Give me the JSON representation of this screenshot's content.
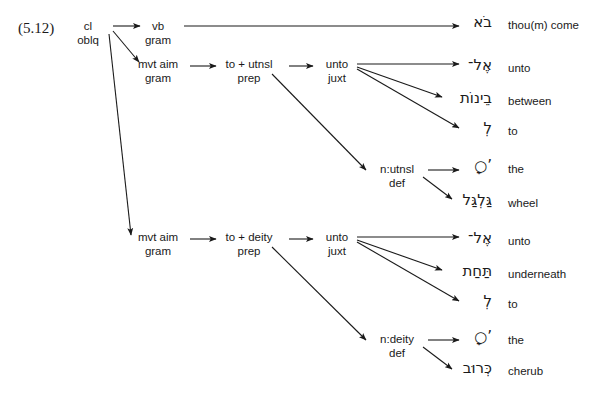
{
  "figure": {
    "number": "(5.12)",
    "canvas": {
      "width": 602,
      "height": 408
    },
    "ink_color": "#1a1a1a",
    "background_color": "#ffffff"
  },
  "nodes": [
    {
      "id": "root",
      "line1": "cl",
      "line2": "oblq",
      "x": 88,
      "y": 20
    },
    {
      "id": "vb",
      "line1": "vb",
      "line2": "gram",
      "x": 158,
      "y": 20
    },
    {
      "id": "mvt1",
      "line1": "mvt aim",
      "line2": "gram",
      "x": 158,
      "y": 58
    },
    {
      "id": "prep1",
      "line1": "to + utnsl",
      "line2": "prep",
      "x": 249,
      "y": 58
    },
    {
      "id": "juxt1",
      "line1": "unto",
      "line2": "juxt",
      "x": 337,
      "y": 58
    },
    {
      "id": "def1",
      "line1": "n:utnsl",
      "line2": "def",
      "x": 397,
      "y": 163
    },
    {
      "id": "mvt2",
      "line1": "mvt aim",
      "line2": "gram",
      "x": 158,
      "y": 231
    },
    {
      "id": "prep2",
      "line1": "to + deity",
      "line2": "prep",
      "x": 249,
      "y": 231
    },
    {
      "id": "juxt2",
      "line1": "unto",
      "line2": "juxt",
      "x": 337,
      "y": 231
    },
    {
      "id": "def2",
      "line1": "n:deity",
      "line2": "def",
      "x": 397,
      "y": 333
    }
  ],
  "terminals": [
    {
      "id": "t-come",
      "hebrew": "בֹא",
      "gloss": "thou(m) come",
      "hx": 492,
      "hy": 14,
      "gx": 508,
      "gy": 18
    },
    {
      "id": "t-unto-1",
      "hebrew": "אֶל־",
      "gloss": "unto",
      "hx": 492,
      "hy": 57,
      "gx": 508,
      "gy": 61
    },
    {
      "id": "t-between",
      "hebrew": "בֵינוֹת",
      "gloss": "between",
      "hx": 492,
      "hy": 90,
      "gx": 508,
      "gy": 94
    },
    {
      "id": "t-to-1",
      "hebrew": "לְ",
      "gloss": "to",
      "hx": 492,
      "hy": 120,
      "gx": 508,
      "gy": 124
    },
    {
      "id": "t-the-1",
      "hebrew": "’○ָ",
      "gloss": "the",
      "hx": 492,
      "hy": 158,
      "gx": 508,
      "gy": 162
    },
    {
      "id": "t-wheel",
      "hebrew": "גַּלְגַּל",
      "gloss": "wheel",
      "hx": 492,
      "hy": 192,
      "gx": 508,
      "gy": 196
    },
    {
      "id": "t-unto-2",
      "hebrew": "אֶל־",
      "gloss": "unto",
      "hx": 492,
      "hy": 230,
      "gx": 508,
      "gy": 234
    },
    {
      "id": "t-underneath",
      "hebrew": "תַּחַת",
      "gloss": "underneath",
      "hx": 492,
      "hy": 263,
      "gx": 508,
      "gy": 267
    },
    {
      "id": "t-to-2",
      "hebrew": "לְ",
      "gloss": "to",
      "hx": 492,
      "hy": 293,
      "gx": 508,
      "gy": 297
    },
    {
      "id": "t-the-2",
      "hebrew": "’○ָ",
      "gloss": "the",
      "hx": 492,
      "hy": 329,
      "gx": 508,
      "gy": 333
    },
    {
      "id": "t-cherub",
      "hebrew": "כְּרוּב",
      "gloss": "cherub",
      "hx": 492,
      "hy": 360,
      "gx": 508,
      "gy": 364
    }
  ],
  "edges": [
    {
      "id": "e-root-vb",
      "from": "root",
      "to": "vb",
      "x1": 113,
      "y1": 26,
      "x2": 140,
      "y2": 26
    },
    {
      "id": "e-root-mvt1",
      "from": "root",
      "to": "mvt aim 1",
      "x1": 113,
      "y1": 31,
      "x2": 139,
      "y2": 62
    },
    {
      "id": "e-root-mvt2",
      "from": "root",
      "to": "mvt aim 2",
      "x1": 109,
      "y1": 34,
      "x2": 131,
      "y2": 235
    },
    {
      "id": "e-vb-come",
      "from": "vb",
      "to": "thou(m) come",
      "x1": 184,
      "y1": 26,
      "x2": 459,
      "y2": 26
    },
    {
      "id": "e-mvt1-prep1",
      "from": "mvt1",
      "to": "prep1",
      "x1": 190,
      "y1": 66,
      "x2": 216,
      "y2": 66
    },
    {
      "id": "e-prep1-juxt1",
      "from": "prep1",
      "to": "juxt1",
      "x1": 289,
      "y1": 66,
      "x2": 313,
      "y2": 66
    },
    {
      "id": "e-prep1-def1",
      "from": "prep1",
      "to": "def1",
      "x1": 272,
      "y1": 74,
      "x2": 366,
      "y2": 170
    },
    {
      "id": "e-juxt1-unto",
      "from": "juxt1",
      "to": "unto",
      "x1": 357,
      "y1": 64,
      "x2": 459,
      "y2": 64
    },
    {
      "id": "e-juxt1-betw",
      "from": "juxt1",
      "to": "between",
      "x1": 357,
      "y1": 67,
      "x2": 442,
      "y2": 97
    },
    {
      "id": "e-juxt1-to",
      "from": "juxt1",
      "to": "to",
      "x1": 357,
      "y1": 69,
      "x2": 459,
      "y2": 128
    },
    {
      "id": "e-def1-the",
      "from": "def1",
      "to": "the",
      "x1": 428,
      "y1": 170,
      "x2": 459,
      "y2": 170
    },
    {
      "id": "e-def1-wheel",
      "from": "def1",
      "to": "wheel",
      "x1": 423,
      "y1": 177,
      "x2": 452,
      "y2": 199
    },
    {
      "id": "e-mvt2-prep2",
      "from": "mvt2",
      "to": "prep2",
      "x1": 190,
      "y1": 239,
      "x2": 216,
      "y2": 239
    },
    {
      "id": "e-prep2-juxt2",
      "from": "prep2",
      "to": "juxt2",
      "x1": 289,
      "y1": 239,
      "x2": 313,
      "y2": 239
    },
    {
      "id": "e-prep2-def2",
      "from": "prep2",
      "to": "def2",
      "x1": 272,
      "y1": 247,
      "x2": 366,
      "y2": 340
    },
    {
      "id": "e-juxt2-unto",
      "from": "juxt2",
      "to": "unto",
      "x1": 357,
      "y1": 237,
      "x2": 459,
      "y2": 237
    },
    {
      "id": "e-juxt2-under",
      "from": "juxt2",
      "to": "underneath",
      "x1": 357,
      "y1": 240,
      "x2": 442,
      "y2": 270
    },
    {
      "id": "e-juxt2-to",
      "from": "juxt2",
      "to": "to",
      "x1": 357,
      "y1": 242,
      "x2": 459,
      "y2": 301
    },
    {
      "id": "e-def2-the",
      "from": "def2",
      "to": "the",
      "x1": 428,
      "y1": 340,
      "x2": 459,
      "y2": 340
    },
    {
      "id": "e-def2-cherub",
      "from": "def2",
      "to": "cherub",
      "x1": 423,
      "y1": 347,
      "x2": 452,
      "y2": 369
    }
  ]
}
